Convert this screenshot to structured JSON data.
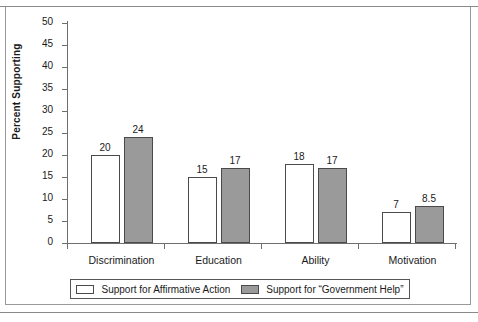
{
  "chart_data": {
    "type": "bar",
    "title": "",
    "xlabel": "",
    "ylabel": "Percent Supporting",
    "ylim": [
      0,
      50
    ],
    "ytick_step": 5,
    "yticks": [
      50,
      45,
      40,
      35,
      30,
      25,
      20,
      15,
      10,
      5,
      0
    ],
    "grid": false,
    "legend_position": "bottom",
    "categories": [
      "Discrimination",
      "Education",
      "Ability",
      "Motivation"
    ],
    "series": [
      {
        "name": "Support for Affirmative Action",
        "color": "#ffffff",
        "values": [
          20,
          15,
          18,
          7
        ],
        "labels": [
          "20",
          "15",
          "18",
          "7"
        ]
      },
      {
        "name": "Support for “Government Help”",
        "color": "#9a9a9a",
        "values": [
          24,
          17,
          17,
          8.5
        ],
        "labels": [
          "24",
          "17",
          "17",
          "8.5"
        ]
      }
    ]
  },
  "legend": {
    "entries": [
      {
        "label": "Support for Affirmative Action",
        "swatch": "white-swatch"
      },
      {
        "label": "Support for “Government Help”",
        "swatch": "gray-swatch"
      }
    ]
  },
  "colors": {
    "series_a": "#ffffff",
    "series_b": "#9a9a9a",
    "axis": "#6f6f6f",
    "text": "#1a1a1a",
    "frame": "#9a9a9a"
  }
}
